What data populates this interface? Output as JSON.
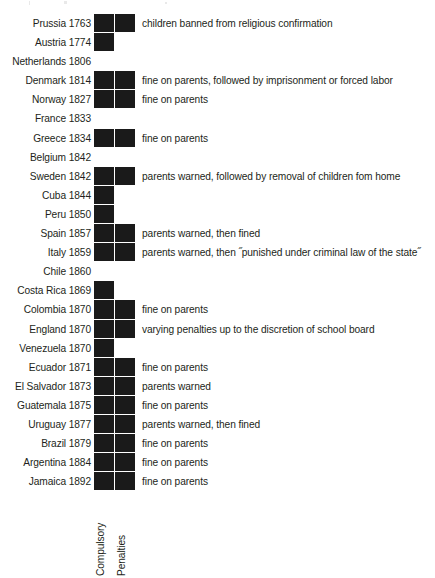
{
  "chart_data": {
    "type": "table",
    "title": "",
    "columns": [
      "Country and year",
      "Compulsory",
      "Penalties",
      "Penalty description"
    ],
    "column_headers_rotated": [
      "Compulsory",
      "Penalties"
    ],
    "legend": [],
    "grid": false,
    "rows": [
      {
        "label": "Prussia 1763",
        "compulsory": true,
        "penalties": true,
        "desc": "children banned from religious confirmation"
      },
      {
        "label": "Austria 1774",
        "compulsory": true,
        "penalties": false,
        "desc": ""
      },
      {
        "label": "Netherlands 1806",
        "compulsory": false,
        "penalties": false,
        "desc": ""
      },
      {
        "label": "Denmark 1814",
        "compulsory": true,
        "penalties": true,
        "desc": "fine on parents, followed by imprisonment or forced labor"
      },
      {
        "label": "Norway 1827",
        "compulsory": true,
        "penalties": true,
        "desc": "fine on parents"
      },
      {
        "label": "France 1833",
        "compulsory": false,
        "penalties": false,
        "desc": ""
      },
      {
        "label": "Greece 1834",
        "compulsory": true,
        "penalties": true,
        "desc": "fine on parents"
      },
      {
        "label": "Belgium 1842",
        "compulsory": false,
        "penalties": false,
        "desc": ""
      },
      {
        "label": "Sweden 1842",
        "compulsory": true,
        "penalties": true,
        "desc": "parents warned, followed by removal of children fom home"
      },
      {
        "label": "Cuba 1844",
        "compulsory": true,
        "penalties": false,
        "desc": ""
      },
      {
        "label": "Peru 1850",
        "compulsory": true,
        "penalties": false,
        "desc": ""
      },
      {
        "label": "Spain 1857",
        "compulsory": true,
        "penalties": true,
        "desc": "parents warned, then fined"
      },
      {
        "label": "Italy 1859",
        "compulsory": true,
        "penalties": true,
        "desc": "parents warned, then ˝punished under criminal law of the state˝"
      },
      {
        "label": "Chile 1860",
        "compulsory": false,
        "penalties": false,
        "desc": ""
      },
      {
        "label": "Costa Rica 1869",
        "compulsory": true,
        "penalties": false,
        "desc": ""
      },
      {
        "label": "Colombia 1870",
        "compulsory": true,
        "penalties": true,
        "desc": "fine on parents"
      },
      {
        "label": "England 1870",
        "compulsory": true,
        "penalties": true,
        "desc": "varying penalties up to the discretion of school board"
      },
      {
        "label": "Venezuela 1870",
        "compulsory": true,
        "penalties": false,
        "desc": ""
      },
      {
        "label": "Ecuador 1871",
        "compulsory": true,
        "penalties": true,
        "desc": "fine on parents"
      },
      {
        "label": "El Salvador 1873",
        "compulsory": true,
        "penalties": true,
        "desc": "parents warned"
      },
      {
        "label": "Guatemala 1875",
        "compulsory": true,
        "penalties": true,
        "desc": "fine on parents"
      },
      {
        "label": "Uruguay 1877",
        "compulsory": true,
        "penalties": true,
        "desc": "parents warned, then fined"
      },
      {
        "label": "Brazil 1879",
        "compulsory": true,
        "penalties": true,
        "desc": "fine on parents"
      },
      {
        "label": "Argentina 1884",
        "compulsory": true,
        "penalties": true,
        "desc": "fine on parents"
      },
      {
        "label": "Jamaica 1892",
        "compulsory": true,
        "penalties": true,
        "desc": "fine on parents"
      }
    ],
    "colors": {
      "mark": "#1a1a1a",
      "text": "#231f20",
      "background": "#ffffff"
    }
  }
}
